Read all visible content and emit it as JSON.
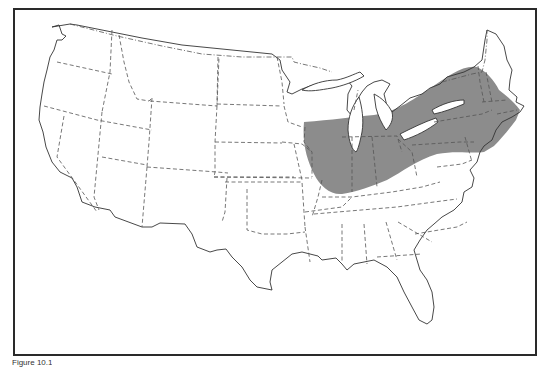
{
  "map": {
    "subject": "Contiguous United States outline map with state borders",
    "highlighted_region": {
      "description": "Shaded range across the Midwest, Great Lakes and Northeast",
      "fill_color": "#8c8c8c",
      "states_covered": [
        "Illinois",
        "Indiana",
        "Ohio",
        "southern Michigan",
        "southern Wisconsin",
        "Iowa (east)",
        "Missouri (northeast)",
        "Pennsylvania",
        "New York",
        "New Jersey",
        "Connecticut",
        "Rhode Island",
        "Massachusetts",
        "Vermont",
        "New Hampshire (south)",
        "Maryland (north)",
        "Kentucky (north)"
      ]
    },
    "colors": {
      "outline": "#333333",
      "frame": "#2a2a2a",
      "background": "#ffffff"
    }
  },
  "caption": {
    "text": "Figure 10.1"
  }
}
